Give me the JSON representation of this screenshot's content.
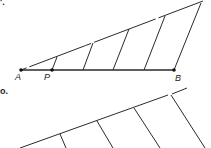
{
  "figure": {
    "part_a_label": "'.",
    "part_b_label": "o.",
    "points": {
      "A": {
        "label": "A",
        "x": 21,
        "y": 70
      },
      "P": {
        "label": "P",
        "x": 52,
        "y": 70
      },
      "B": {
        "label": "B",
        "x": 174,
        "y": 70
      }
    },
    "ray_end": {
      "x": 203,
      "y": 1
    },
    "parallels": [
      {
        "x1": 52,
        "y1": 70,
        "x2": 57,
        "y2": 57
      },
      {
        "x1": 83,
        "y1": 70,
        "x2": 93,
        "y2": 43
      },
      {
        "x1": 113,
        "y1": 70,
        "x2": 129,
        "y2": 29
      },
      {
        "x1": 144,
        "y1": 70,
        "x2": 165,
        "y2": 16
      },
      {
        "x1": 174,
        "y1": 70,
        "x2": 201,
        "y2": 3
      }
    ],
    "part_b": {
      "ray": {
        "x1": 20,
        "y1": 148,
        "x2": 187,
        "y2": 88
      },
      "parallels": [
        {
          "x1": 60,
          "y1": 135,
          "x2": 66,
          "y2": 148
        },
        {
          "x1": 97,
          "y1": 122,
          "x2": 113,
          "y2": 148
        },
        {
          "x1": 134,
          "y1": 108,
          "x2": 160,
          "y2": 148
        },
        {
          "x1": 171,
          "y1": 95,
          "x2": 205,
          "y2": 148
        }
      ]
    }
  }
}
